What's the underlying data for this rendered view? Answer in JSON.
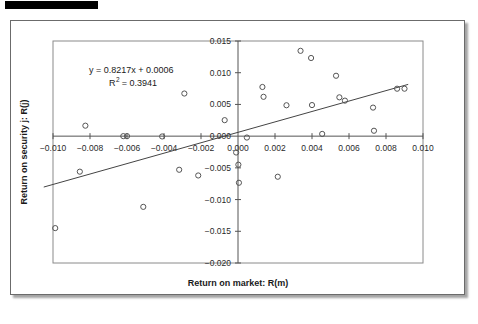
{
  "chart_data": {
    "type": "scatter",
    "title": "",
    "xlabel": "Return on market: R(m)",
    "ylabel": "Return on security j: R(j)",
    "xlim": [
      -0.01,
      0.01
    ],
    "ylim": [
      -0.02,
      0.015
    ],
    "xticks": [
      -0.01,
      -0.008,
      -0.006,
      -0.004,
      -0.002,
      0.0,
      0.002,
      0.004,
      0.006,
      0.008,
      0.01
    ],
    "xtick_labels": [
      "-0.010",
      "-0.008",
      "-0.006",
      "-0.004",
      "-0.002",
      "0.000",
      "0.002",
      "0.004",
      "0.006",
      "0.008",
      "0.010"
    ],
    "yticks": [
      0.015,
      0.01,
      0.005,
      0.0,
      -0.005,
      -0.01,
      -0.015,
      -0.02
    ],
    "ytick_labels": [
      "0.015",
      "0.010",
      "0.005",
      "0.000",
      "-0.005",
      "-0.010",
      "-0.015",
      "-0.020"
    ],
    "grid": false,
    "legend": false,
    "annotations": {
      "equation": "y = 0.8217x + 0.0006",
      "r_squared_label": "R",
      "r_squared_exponent": "2",
      "r_squared_value": "= 0.3941"
    },
    "trendline": {
      "slope": 0.8217,
      "intercept": 0.0006,
      "r_squared": 0.3941,
      "x_start": -0.0105,
      "x_end": 0.0092
    },
    "series": [
      {
        "name": "Observations",
        "marker": "open-circle",
        "color": "#555555",
        "points": [
          [
            -0.00988,
            -0.0145
          ],
          [
            -0.00855,
            -0.0056
          ],
          [
            -0.00825,
            0.00165
          ],
          [
            -0.0062,
            0.0
          ],
          [
            -0.006,
            0.0
          ],
          [
            -0.00512,
            -0.01115
          ],
          [
            -0.0041,
            -5e-05
          ],
          [
            -0.00318,
            -0.0053
          ],
          [
            -0.0029,
            0.00672
          ],
          [
            -0.00215,
            -0.0062
          ],
          [
            -0.00072,
            0.00252
          ],
          [
            -0.0001,
            -0.00258
          ],
          [
            2e-05,
            -0.0045
          ],
          [
            5e-05,
            -0.00735
          ],
          [
            0.00048,
            -0.00022
          ],
          [
            0.00132,
            0.00775
          ],
          [
            0.00138,
            0.0062
          ],
          [
            0.00215,
            -0.0064
          ],
          [
            0.00262,
            0.00487
          ],
          [
            0.00338,
            0.01345
          ],
          [
            0.00395,
            0.01232
          ],
          [
            0.004,
            0.0049
          ],
          [
            0.00455,
            0.00035
          ],
          [
            0.0053,
            0.00952
          ],
          [
            0.00548,
            0.00612
          ],
          [
            0.00578,
            0.0056
          ],
          [
            0.0073,
            0.0045
          ],
          [
            0.00735,
            0.00085
          ],
          [
            0.0086,
            0.00748
          ],
          [
            0.009,
            0.00748
          ]
        ]
      }
    ]
  }
}
